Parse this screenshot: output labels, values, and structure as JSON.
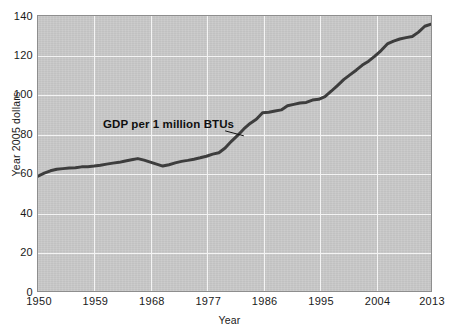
{
  "chart_data": {
    "type": "line",
    "title": "",
    "xlabel": "Year",
    "ylabel": "Year 2005 dollars",
    "xlim": [
      1950,
      2013
    ],
    "ylim": [
      0,
      140
    ],
    "grid": true,
    "legend_position": "none",
    "xticks": [
      "1950",
      "1959",
      "1968",
      "1977",
      "1986",
      "1995",
      "2004",
      "2013"
    ],
    "yticks": [
      "0",
      "20",
      "40",
      "60",
      "80",
      "100",
      "120",
      "140"
    ],
    "annotations": [
      {
        "text": "GDP per 1 million BTUs",
        "x": 1963,
        "y": 83,
        "leader_to_x": 1983,
        "leader_to_y": 79
      }
    ],
    "series": [
      {
        "name": "GDP per 1 million BTUs",
        "color": "#3d3d3d",
        "x": [
          1950,
          1951,
          1952,
          1953,
          1954,
          1955,
          1956,
          1957,
          1958,
          1959,
          1960,
          1961,
          1962,
          1963,
          1964,
          1965,
          1966,
          1967,
          1968,
          1969,
          1970,
          1971,
          1972,
          1973,
          1974,
          1975,
          1976,
          1977,
          1978,
          1979,
          1980,
          1981,
          1982,
          1983,
          1984,
          1985,
          1986,
          1987,
          1988,
          1989,
          1990,
          1991,
          1992,
          1993,
          1994,
          1995,
          1996,
          1997,
          1998,
          1999,
          2000,
          2001,
          2002,
          2003,
          2004,
          2005,
          2006,
          2007,
          2008,
          2009,
          2010,
          2011,
          2012,
          2013
        ],
        "y": [
          58.5,
          60.0,
          61.2,
          62.0,
          62.3,
          62.6,
          62.7,
          63.2,
          63.3,
          63.6,
          64.0,
          64.6,
          65.1,
          65.5,
          66.2,
          66.8,
          67.4,
          66.6,
          65.6,
          64.6,
          63.6,
          64.3,
          65.2,
          66.0,
          66.5,
          67.1,
          67.8,
          68.6,
          69.7,
          70.4,
          72.8,
          76.2,
          79.2,
          82.5,
          85.3,
          87.4,
          90.8,
          91.0,
          91.6,
          92.2,
          94.3,
          95.0,
          95.7,
          96.0,
          97.2,
          97.6,
          99.0,
          101.7,
          104.6,
          107.6,
          110.0,
          112.4,
          115.0,
          117.0,
          119.6,
          122.4,
          125.8,
          127.2,
          128.3,
          129.0,
          129.6,
          131.8,
          134.8,
          135.8
        ]
      }
    ]
  },
  "axes": {
    "y_title": "Year 2005 dollars",
    "x_title": "Year"
  }
}
